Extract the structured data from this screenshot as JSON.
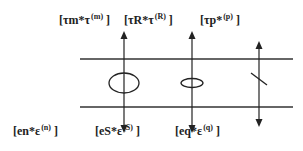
{
  "diagram": {
    "top_labels": [
      {
        "base": "[τm*τ",
        "sup": "(m)",
        "close": "]"
      },
      {
        "base": "[τR*τ",
        "sup": "(R)",
        "close": "]"
      },
      {
        "base": "[τp*",
        "sup": "(p)",
        "close": "]"
      }
    ],
    "bottom_labels": [
      {
        "base": "[en*ε",
        "sup": "(n)",
        "close": "]"
      },
      {
        "base": "[eS*ε",
        "sup": "(S)",
        "close": "]"
      },
      {
        "base": "[eq*ε",
        "sup": "(q)",
        "close": "]"
      }
    ],
    "elements": [
      {
        "type": "large-ellipse",
        "description": "element on first vertical"
      },
      {
        "type": "small-ellipse",
        "description": "element on second vertical"
      },
      {
        "type": "diagonal-slash",
        "description": "element on third vertical"
      }
    ],
    "colors": {
      "stroke": "#222222",
      "text": "#222222",
      "background": "#ffffff"
    }
  }
}
